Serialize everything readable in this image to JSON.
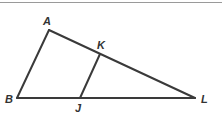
{
  "figure": {
    "type": "triangle-with-segment",
    "stroke_color": "#3a3a3a",
    "label_color": "#333333",
    "points": {
      "A": {
        "label": "A",
        "x": 49,
        "y": 30,
        "label_x": 43,
        "label_y": 25
      },
      "B": {
        "label": "B",
        "x": 17,
        "y": 98,
        "label_x": 5,
        "label_y": 103
      },
      "J": {
        "label": "J",
        "x": 80,
        "y": 98,
        "label_x": 75,
        "label_y": 112
      },
      "K": {
        "label": "K",
        "x": 100,
        "y": 54,
        "label_x": 97,
        "label_y": 49
      },
      "L": {
        "label": "L",
        "x": 195,
        "y": 98,
        "label_x": 201,
        "label_y": 103
      }
    },
    "segments": [
      {
        "name": "AB",
        "from": "A",
        "to": "B"
      },
      {
        "name": "AL",
        "from": "A",
        "to": "L"
      },
      {
        "name": "BL",
        "from": "B",
        "to": "L"
      },
      {
        "name": "JK",
        "from": "J",
        "to": "K"
      }
    ]
  }
}
